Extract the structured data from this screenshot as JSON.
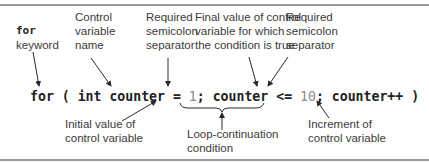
{
  "diagram": {
    "code": {
      "kw_for": "for",
      "open_paren": " ( ",
      "kw_int": "int",
      "var_decl": " counter = ",
      "init_value": "1",
      "semi1": "; ",
      "cond_var": "counter <= ",
      "final_value": "10",
      "semi2": "; ",
      "increment": "counter++",
      "close_paren": " )"
    },
    "annotations": {
      "for_keyword": {
        "line1": "for",
        "line2": "keyword"
      },
      "control_variable_name": {
        "line1": "Control",
        "line2": "variable",
        "line3": "name"
      },
      "semicolon_1": {
        "line1": "Required",
        "line2": "semicolon",
        "line3": "separator"
      },
      "final_value": {
        "line1": "Final value of control",
        "line2": "variable for which",
        "line3": "the condition is true"
      },
      "semicolon_2": {
        "line1": "Required",
        "line2": "semicolon",
        "line3": "separator"
      },
      "initial_value": {
        "line1": "Initial value of",
        "line2": "control variable"
      },
      "loop_condition": {
        "line1": "Loop-continuation",
        "line2": "condition"
      },
      "increment": {
        "line1": "Increment of",
        "line2": "control variable"
      }
    },
    "colors": {
      "text": "#3a3a3a",
      "code": "#222222",
      "numbers": "#8a8a8a",
      "border": "#9a9a9a",
      "arrow": "#2a2a2a"
    }
  }
}
